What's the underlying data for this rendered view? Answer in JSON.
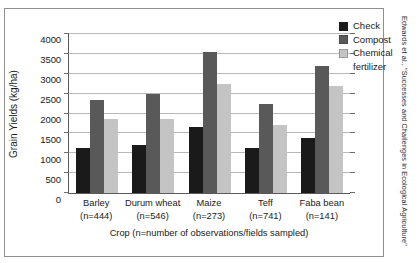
{
  "chart_data": {
    "type": "bar",
    "title": "",
    "xlabel": "Crop (n=number of observations/fields sampled)",
    "ylabel": "Grain Yields (kg/ha)",
    "ylim": [
      0,
      4000
    ],
    "yticks": [
      0,
      500,
      1000,
      1500,
      2000,
      2500,
      3000,
      3500,
      4000
    ],
    "ytick_labels": [
      "0",
      "500",
      "1000",
      "1500",
      "2000",
      "2500",
      "3000",
      "3500",
      "4000"
    ],
    "grid": "horizontal",
    "legend_position": "top-right-inside",
    "categories": [
      "Barley",
      "Durum wheat",
      "Maize",
      "Teff",
      "Faba bean"
    ],
    "category_sublabels": [
      "(n=444)",
      "(n=546)",
      "(n=273)",
      "(n=741)",
      "(n=141)"
    ],
    "series": [
      {
        "name": "Check",
        "color": "#1a1a1a",
        "values": [
          1120,
          1220,
          1650,
          1130,
          1380
        ]
      },
      {
        "name": "Compost",
        "color": "#595959",
        "values": [
          2340,
          2490,
          3550,
          2250,
          3200
        ]
      },
      {
        "name": "Chemical fertilizer",
        "color": "#c4c4c4",
        "values": [
          1850,
          1850,
          2750,
          1720,
          2700
        ]
      }
    ]
  },
  "legend": {
    "items": [
      {
        "label": "Check",
        "continuation": ""
      },
      {
        "label": "Compost",
        "continuation": ""
      },
      {
        "label": "Chemical",
        "continuation": "fertilizer"
      }
    ]
  },
  "citation": "Edwards et al., \"Successes and Challenges in Ecological Agriculture\""
}
